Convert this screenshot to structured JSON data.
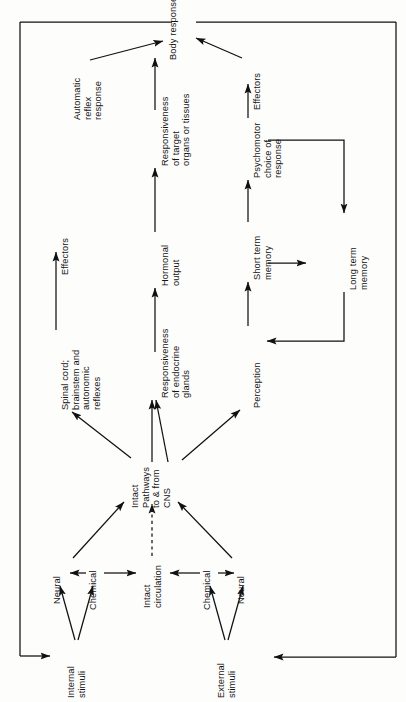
{
  "diagram": {
    "orientation": "labels-rotated-90-ccw",
    "frame_color": "#111111",
    "line_color": "#111111",
    "background": "#fdfdfc",
    "nodes": {
      "body_response": "Body response",
      "automatic_reflex_response": "Automatic\nreflex\nresponse",
      "spinal_cord": "Spinal cord;\nbrainstem and\nautonomic\nreflexes",
      "responsiveness_target": "Responsiveness\nof target\norgans or tissues",
      "hormonal_output": "Hormonal\noutput",
      "responsiveness_endocrine": "Responsiveness\nof endocrine\nglands",
      "psychomotor_choice": "Psychomotor\nchoice of\nresponse",
      "short_term_memory": "Short term\nmemory",
      "long_term_memory": "Long term\nmemory",
      "perception": "Perception",
      "intact_pathways_cns": "Intact\nPathways\nto & from\nCNS",
      "neural_left": "Neural",
      "chemical_left": "Chemical",
      "intact_circulation": "Intact\ncirculation",
      "chemical_right": "Chemical",
      "neural_right": "Neural",
      "internal_stimuli": "Internal\nstimuli",
      "external_stimuli": "External\nstimuli"
    },
    "edge_labels": {
      "effectors_left": "Effectors",
      "effectors_right": "Effectors"
    },
    "flows": [
      {
        "from": "Internal stimuli",
        "to": "Neural",
        "style": "solid"
      },
      {
        "from": "Internal stimuli",
        "to": "Chemical",
        "style": "solid"
      },
      {
        "from": "External stimuli",
        "to": "Neural",
        "style": "solid"
      },
      {
        "from": "External stimuli",
        "to": "Chemical",
        "style": "solid"
      },
      {
        "from": "Chemical",
        "to": "Neural",
        "style": "bidirectional"
      },
      {
        "from": "Chemical",
        "to": "Intact circulation",
        "style": "bidirectional"
      },
      {
        "from": "Neural",
        "to": "Intact Pathways to & from CNS",
        "style": "solid"
      },
      {
        "from": "Intact circulation",
        "to": "Intact Pathways to & from CNS",
        "style": "dashed"
      },
      {
        "from": "Intact Pathways to & from CNS",
        "to": "Spinal cord; brainstem and autonomic reflexes",
        "style": "solid"
      },
      {
        "from": "Intact Pathways to & from CNS",
        "to": "Responsiveness of endocrine glands",
        "style": "solid"
      },
      {
        "from": "Intact Pathways to & from CNS",
        "to": "Perception",
        "style": "solid"
      },
      {
        "from": "Spinal cord; brainstem and autonomic reflexes",
        "to": "Automatic reflex response",
        "style": "solid",
        "label": "Effectors"
      },
      {
        "from": "Automatic reflex response",
        "to": "Body response",
        "style": "solid"
      },
      {
        "from": "Responsiveness of endocrine glands",
        "to": "Hormonal output",
        "style": "solid"
      },
      {
        "from": "Hormonal output",
        "to": "Responsiveness of target organs or tissues",
        "style": "solid"
      },
      {
        "from": "Responsiveness of target organs or tissues",
        "to": "Body response",
        "style": "solid"
      },
      {
        "from": "Perception",
        "to": "Short term memory",
        "style": "solid"
      },
      {
        "from": "Short term memory",
        "to": "Psychomotor choice of response",
        "style": "solid"
      },
      {
        "from": "Short term memory",
        "to": "Long term memory",
        "style": "solid"
      },
      {
        "from": "Psychomotor choice of response",
        "to": "Long term memory",
        "style": "solid"
      },
      {
        "from": "Long term memory",
        "to": "Perception",
        "style": "solid"
      },
      {
        "from": "Psychomotor choice of response",
        "to": "Body response",
        "style": "solid",
        "label": "Effectors"
      },
      {
        "from": "Body response",
        "to": "Internal stimuli",
        "style": "feedback-loop"
      },
      {
        "from": "Body response",
        "to": "External stimuli",
        "style": "feedback-loop"
      }
    ]
  }
}
